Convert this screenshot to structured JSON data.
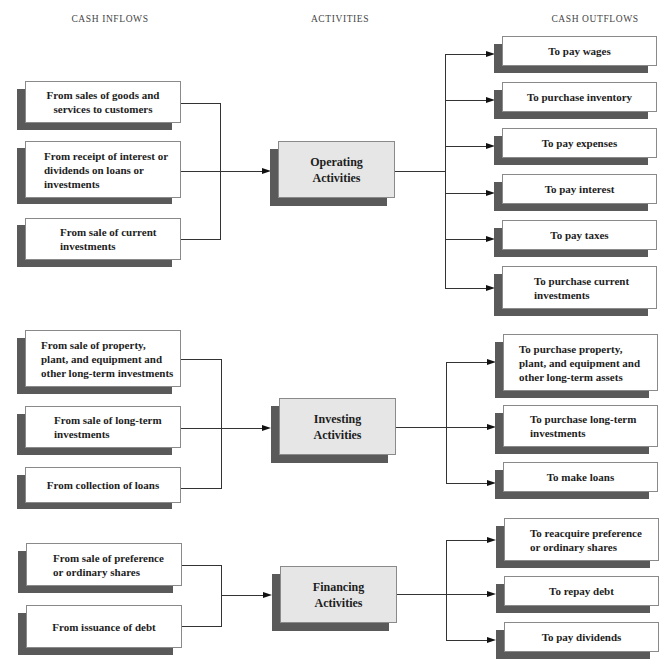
{
  "headers": {
    "inflows": "CASH INFLOWS",
    "activities": "ACTIVITIES",
    "outflows": "CASH OUTFLOWS"
  },
  "colors": {
    "shadow": "#5a5a5a",
    "activity_fill": "#e6e6e6",
    "box_fill": "#ffffff",
    "line": "#333333"
  },
  "operating": {
    "activity": "Operating Activities",
    "inflows": [
      "From sales of goods and services to customers",
      "From receipt of interest or dividends on loans or investments",
      "From sale of current investments"
    ],
    "outflows": [
      "To pay wages",
      "To purchase inventory",
      "To pay expenses",
      "To pay interest",
      "To pay taxes",
      "To purchase current investments"
    ]
  },
  "investing": {
    "activity": "Investing Activities",
    "inflows": [
      "From sale of property, plant, and equipment and other long-term investments",
      "From sale of long-term investments",
      "From collection of loans"
    ],
    "outflows": [
      "To purchase property, plant, and equipment and other long-term assets",
      "To purchase long-term investments",
      "To make loans"
    ]
  },
  "financing": {
    "activity": "Financing Activities",
    "inflows": [
      "From sale of preference or ordinary shares",
      "From issuance of debt"
    ],
    "outflows": [
      "To reacquire preference or ordinary shares",
      "To repay debt",
      "To pay dividends"
    ]
  }
}
